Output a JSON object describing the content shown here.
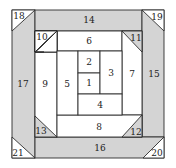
{
  "diagram": {
    "type": "quilt-block-piecing-order",
    "colors": {
      "shaded": "#d4d4d4",
      "light": "#ffffff",
      "line": "#2e2e2e",
      "text": "#222222"
    },
    "pieces": {
      "p1": "1",
      "p2": "2",
      "p3": "3",
      "p4": "4",
      "p5": "5",
      "p6": "6",
      "p7": "7",
      "p8": "8",
      "p9": "9",
      "p10": "10",
      "p11": "11",
      "p12": "12",
      "p13": "13",
      "p14": "14",
      "p15": "15",
      "p16": "16",
      "p17": "17",
      "p18": "18",
      "p19": "19",
      "p20": "20",
      "p21": "21"
    }
  }
}
